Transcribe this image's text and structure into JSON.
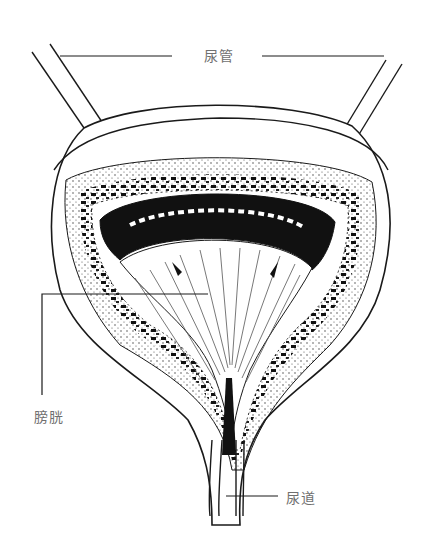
{
  "diagram": {
    "labels": {
      "ureter": "尿管",
      "bladder": "膀胱",
      "urethra": "尿道"
    },
    "colors": {
      "line": "#1a1a1a",
      "label_text": "#6f6f6f",
      "background": "#ffffff"
    }
  }
}
